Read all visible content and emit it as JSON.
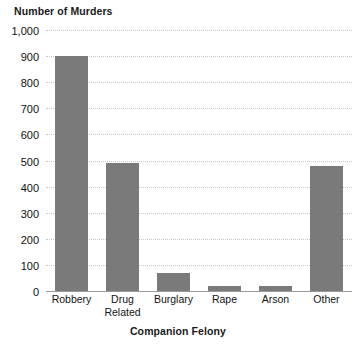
{
  "chart_data": {
    "type": "bar",
    "title": "",
    "xlabel": "Companion Felony",
    "ylabel": "Number of Murders",
    "categories": [
      "Robbery",
      "Drug Related",
      "Burglary",
      "Rape",
      "Arson",
      "Other"
    ],
    "category_lines": [
      [
        "Robbery"
      ],
      [
        "Drug",
        "Related"
      ],
      [
        "Burglary"
      ],
      [
        "Rape"
      ],
      [
        "Arson"
      ],
      [
        "Other"
      ]
    ],
    "values": [
      900,
      490,
      70,
      20,
      20,
      480
    ],
    "ylim": [
      0,
      1000
    ],
    "ytick_values": [
      0,
      100,
      200,
      300,
      400,
      500,
      600,
      700,
      800,
      900,
      1000
    ],
    "ytick_labels": [
      "0",
      "100",
      "200",
      "300",
      "400",
      "500",
      "600",
      "700",
      "800",
      "900",
      "1,000"
    ],
    "grid": true,
    "grid_axis": "y",
    "grid_style": "dotted",
    "legend": false,
    "bar_color": "#7a7a7a",
    "grid_color": "#c9c9c9",
    "axis_color": "#9a9a9a",
    "background_color": "#ffffff"
  }
}
